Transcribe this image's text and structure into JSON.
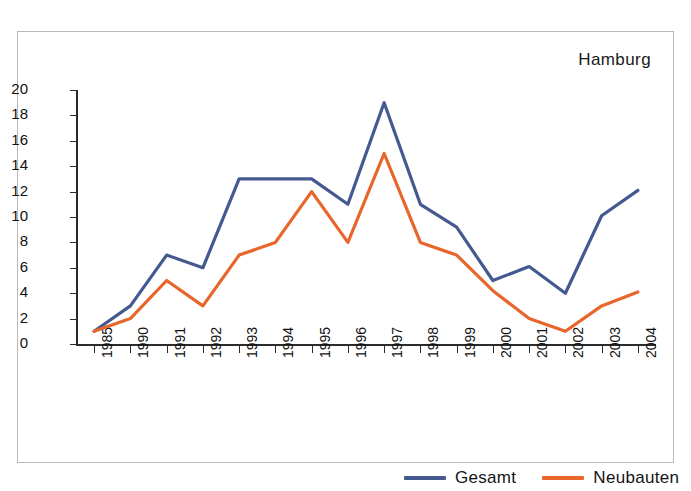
{
  "chart_data": {
    "type": "line",
    "title": "Hamburg",
    "xlabel": "",
    "ylabel": "",
    "ylim": [
      0,
      20
    ],
    "ytick_step": 2,
    "yticks": [
      0,
      2,
      4,
      6,
      8,
      10,
      12,
      14,
      16,
      18,
      20
    ],
    "grid": false,
    "legend_position": "bottom-right",
    "categories": [
      "1985",
      "1990",
      "1991",
      "1992",
      "1993",
      "1994",
      "1995",
      "1996",
      "1997",
      "1998",
      "1999",
      "2000",
      "2001",
      "2002",
      "2003",
      "2004"
    ],
    "series": [
      {
        "name": "Gesamt",
        "color": "#44598f",
        "values": [
          1,
          3,
          7,
          6,
          13,
          13,
          13,
          11,
          19,
          11,
          9.2,
          5,
          6.1,
          4,
          10.1,
          12.1
        ]
      },
      {
        "name": "Neubauten",
        "color": "#e8662c",
        "values": [
          1,
          2,
          5,
          3,
          7,
          8,
          12,
          8,
          15,
          8,
          7,
          4.2,
          2,
          1,
          3,
          4.1
        ]
      }
    ]
  },
  "legend": {
    "items": [
      {
        "label": "Gesamt",
        "color": "#44598f"
      },
      {
        "label": "Neubauten",
        "color": "#e8662c"
      }
    ]
  }
}
